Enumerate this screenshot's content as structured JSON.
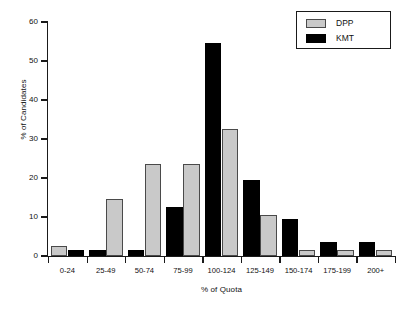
{
  "chart_data": {
    "type": "bar",
    "title": "",
    "xlabel": "% of Quota",
    "ylabel": "% of Candidates",
    "categories": [
      "0-24",
      "25-49",
      "50-74",
      "75-99",
      "100-124",
      "125-149",
      "150-174",
      "175-199",
      "200+"
    ],
    "series": [
      {
        "name": "DPP",
        "color": "#c9c9c9",
        "values": [
          2.5,
          14.5,
          23.5,
          23.5,
          32.5,
          10.5,
          1.5,
          1.5,
          1.5
        ]
      },
      {
        "name": "KMT",
        "color": "#000000",
        "values": [
          1.5,
          1.5,
          1.5,
          12.5,
          54.5,
          19.5,
          9.5,
          3.5,
          3.5
        ]
      }
    ],
    "series_order_per_category": [
      [
        "DPP",
        "KMT"
      ],
      [
        "KMT",
        "DPP"
      ],
      [
        "KMT",
        "DPP"
      ],
      [
        "KMT",
        "DPP"
      ],
      [
        "KMT",
        "DPP"
      ],
      [
        "KMT",
        "DPP"
      ],
      [
        "KMT",
        "DPP"
      ],
      [
        "KMT",
        "DPP"
      ],
      [
        "KMT",
        "DPP"
      ]
    ],
    "ylim": [
      0,
      60
    ],
    "yticks": [
      0,
      10,
      20,
      30,
      40,
      50,
      60
    ],
    "ytick_labels": [
      "0",
      "10",
      "20",
      "30",
      "40",
      "50",
      "60"
    ],
    "grid": false,
    "legend_position": "top-right",
    "legend_entries": [
      "DPP",
      "KMT"
    ]
  },
  "legend": {
    "entries": [
      {
        "label": "DPP",
        "swatch": "dpp"
      },
      {
        "label": "KMT",
        "swatch": "kmt"
      }
    ]
  },
  "axes": {
    "x_title": "% of Quota",
    "y_title": "% of Candidates"
  }
}
